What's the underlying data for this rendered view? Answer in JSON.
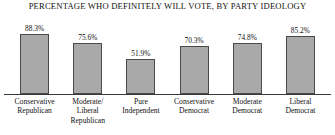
{
  "chart_data": {
    "type": "bar",
    "title": "PERCENTAGE WHO DEFINITELY WILL VOTE, BY PARTY IDEOLOGY",
    "xlabel": "",
    "ylabel": "",
    "ylim": [
      0,
      100
    ],
    "grid": false,
    "legend": false,
    "categories": [
      "Conservative Republican",
      "Moderate/ Liberal Republican",
      "Pure Independent",
      "Conservative Democrat",
      "Moderate Democrat",
      "Liberal Democrat"
    ],
    "category_lines": [
      [
        "Conservative",
        "Republican"
      ],
      [
        "Moderate/",
        "Liberal",
        "Republican"
      ],
      [
        "Pure",
        "Independent"
      ],
      [
        "Conservative",
        "Democrat"
      ],
      [
        "Moderate",
        "Democrat"
      ],
      [
        "Liberal",
        "Democrat"
      ]
    ],
    "values": [
      88.3,
      75.6,
      51.9,
      70.3,
      74.8,
      85.2
    ],
    "value_labels": [
      "88.3%",
      "75.6%",
      "51.9%",
      "70.3%",
      "74.8%",
      "85.2%"
    ],
    "bar_fill_color": "#a9a9a9",
    "bar_border_color": "#4a4a4a",
    "axis_color": "#3a3a3a",
    "background_color": "#ffffff"
  }
}
